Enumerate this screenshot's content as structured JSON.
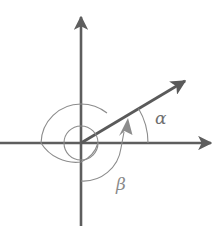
{
  "diagram": {
    "labels": {
      "alpha": "α",
      "beta": "β"
    },
    "colors": {
      "axis": "#5e5e5e",
      "vector": "#5a5a5a",
      "arc": "#8c8c8c",
      "label": "#6f6f6f"
    },
    "geometry": {
      "origin": [
        81,
        143
      ],
      "vertical_axis": {
        "x": 81,
        "y_top": 15,
        "y_bottom": 226
      },
      "horizontal_axis": {
        "y": 143,
        "x_left": 0,
        "x_right": 213
      },
      "vector_tip": [
        187,
        80
      ],
      "alpha_arc_radius": 67,
      "spiral_inner_radius": 17,
      "spiral_outer_radius": 40
    }
  }
}
